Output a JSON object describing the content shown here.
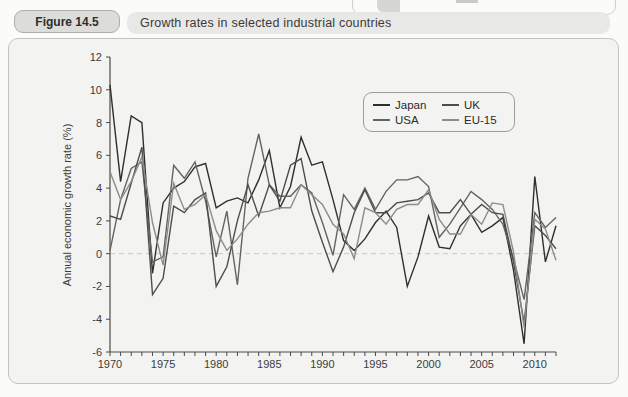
{
  "figure": {
    "label": "Figure 14.5",
    "title": "Growth rates in selected industrial countries"
  },
  "legend": {
    "items": [
      {
        "label": "Japan",
        "color": "#2f2f2f"
      },
      {
        "label": "UK",
        "color": "#4d4d4d"
      },
      {
        "label": "USA",
        "color": "#636363"
      },
      {
        "label": "EU-15",
        "color": "#8c8c8c"
      }
    ]
  },
  "chart_data": {
    "type": "line",
    "title": "Growth rates in selected industrial countries",
    "xlabel": "",
    "ylabel": "Annual economic growth rate (%)",
    "x_range": [
      1970,
      2012
    ],
    "ylim": [
      -6,
      12
    ],
    "y_ticks": [
      -6,
      -4,
      -2,
      0,
      2,
      4,
      6,
      8,
      10,
      12
    ],
    "x_tick_labels": [
      1970,
      1975,
      1980,
      1985,
      1990,
      1995,
      2000,
      2005,
      2010
    ],
    "zero_line": "dashed",
    "grid": false,
    "legend_position": "top-right-inside",
    "years": [
      1970,
      1971,
      1972,
      1973,
      1974,
      1975,
      1976,
      1977,
      1978,
      1979,
      1980,
      1981,
      1982,
      1983,
      1984,
      1985,
      1986,
      1987,
      1988,
      1989,
      1990,
      1991,
      1992,
      1993,
      1994,
      1995,
      1996,
      1997,
      1998,
      1999,
      2000,
      2001,
      2002,
      2003,
      2004,
      2005,
      2006,
      2007,
      2008,
      2009,
      2010,
      2011,
      2012
    ],
    "series": [
      {
        "name": "Japan",
        "color": "#2f2f2f",
        "values": [
          10.3,
          4.4,
          8.4,
          8.0,
          -1.2,
          3.1,
          4.0,
          4.4,
          5.3,
          5.5,
          2.8,
          3.2,
          3.4,
          3.1,
          4.5,
          6.3,
          2.8,
          4.1,
          7.1,
          5.4,
          5.6,
          3.3,
          0.8,
          0.2,
          0.9,
          1.9,
          2.6,
          1.6,
          -2.0,
          -0.2,
          2.3,
          0.4,
          0.3,
          1.7,
          2.4,
          1.3,
          1.7,
          2.2,
          -1.0,
          -5.5,
          4.7,
          -0.5,
          1.7
        ]
      },
      {
        "name": "USA",
        "color": "#636363",
        "values": [
          0.2,
          3.3,
          5.2,
          5.6,
          -0.5,
          -0.2,
          5.4,
          4.6,
          5.6,
          3.2,
          -0.2,
          2.6,
          -1.9,
          4.6,
          7.3,
          4.2,
          3.5,
          3.5,
          4.2,
          3.7,
          1.9,
          -0.1,
          3.6,
          2.7,
          4.0,
          2.7,
          3.8,
          4.5,
          4.5,
          4.7,
          4.1,
          1.0,
          1.8,
          2.8,
          3.8,
          3.3,
          2.7,
          1.8,
          -0.3,
          -2.8,
          2.5,
          1.6,
          2.2
        ]
      },
      {
        "name": "UK",
        "color": "#4d4d4d",
        "values": [
          2.3,
          2.1,
          4.3,
          6.5,
          -2.5,
          -1.5,
          2.9,
          2.5,
          3.3,
          3.7,
          -2.0,
          -0.8,
          2.0,
          4.2,
          2.3,
          4.2,
          3.2,
          5.4,
          5.8,
          2.6,
          0.7,
          -1.1,
          0.4,
          2.5,
          3.9,
          2.5,
          2.5,
          3.1,
          3.2,
          3.3,
          3.7,
          2.5,
          2.5,
          3.3,
          2.4,
          3.0,
          2.5,
          2.4,
          -0.5,
          -4.2,
          1.7,
          1.1,
          0.3
        ]
      },
      {
        "name": "EU-15",
        "color": "#8c8c8c",
        "values": [
          5.0,
          3.3,
          4.4,
          5.9,
          1.9,
          -0.7,
          4.3,
          2.7,
          3.0,
          3.6,
          1.4,
          0.2,
          0.9,
          1.8,
          2.5,
          2.6,
          2.8,
          2.8,
          4.2,
          3.6,
          3.0,
          1.8,
          1.2,
          -0.3,
          2.8,
          2.5,
          1.8,
          2.7,
          3.0,
          3.0,
          3.9,
          2.1,
          1.2,
          1.2,
          2.4,
          1.8,
          3.1,
          3.0,
          0.1,
          -4.5,
          2.1,
          1.5,
          -0.4
        ]
      }
    ]
  }
}
